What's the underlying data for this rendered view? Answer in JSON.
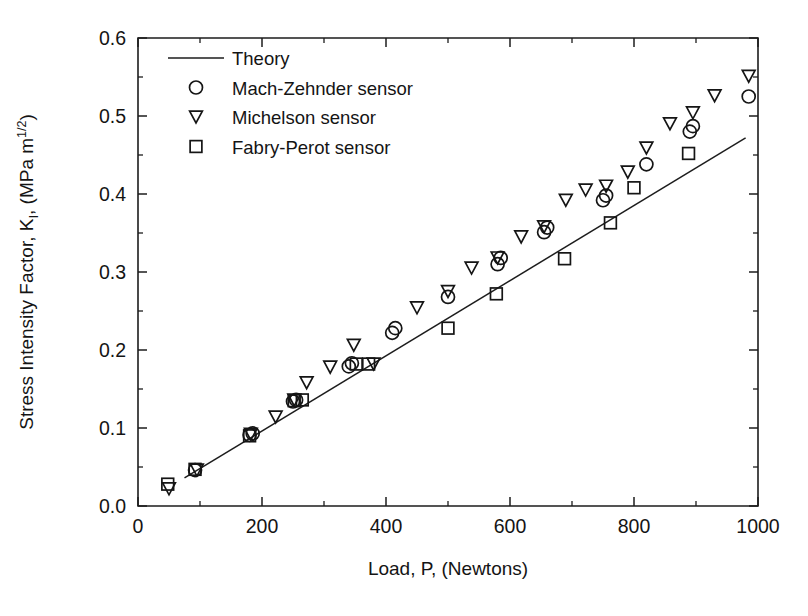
{
  "chart_data": {
    "type": "scatter",
    "title": "",
    "xlabel": "Load, P, (Newtons)",
    "ylabel": "Stress Intensity Factor, K",
    "ylabel_sub": "I",
    "ylabel_tail": ", (MPa m",
    "ylabel_sup": "1/2",
    "ylabel_end": ")",
    "xlim": [
      0,
      1000
    ],
    "ylim": [
      0.0,
      0.6
    ],
    "xticks": [
      0,
      200,
      400,
      600,
      800,
      1000
    ],
    "xticklabels": [
      "0",
      "200",
      "400",
      "600",
      "800",
      "1000"
    ],
    "xminorticks": [
      100,
      300,
      500,
      700,
      900
    ],
    "yticks": [
      0.0,
      0.1,
      0.2,
      0.3,
      0.4,
      0.5,
      0.6
    ],
    "yticklabels": [
      "0.0",
      "0.1",
      "0.2",
      "0.3",
      "0.4",
      "0.5",
      "0.6"
    ],
    "yminorticks": [
      0.05,
      0.15,
      0.25,
      0.35,
      0.45,
      0.55
    ],
    "grid": false,
    "legend_position": "upper-left",
    "legend": [
      {
        "label": "Theory",
        "marker": "line"
      },
      {
        "label": "Mach-Zehnder sensor",
        "marker": "circle"
      },
      {
        "label": "Michelson sensor",
        "marker": "triangle-down"
      },
      {
        "label": "Fabry-Perot sensor",
        "marker": "square"
      }
    ],
    "series": [
      {
        "name": "Theory",
        "marker": "line",
        "color": "#1d1d1d",
        "x": [
          75,
          980
        ],
        "y": [
          0.036,
          0.472
        ]
      },
      {
        "name": "Mach-Zehnder sensor",
        "marker": "circle",
        "color": "#151515",
        "points": [
          [
            92,
            0.046
          ],
          [
            180,
            0.091
          ],
          [
            185,
            0.093
          ],
          [
            250,
            0.134
          ],
          [
            255,
            0.136
          ],
          [
            340,
            0.179
          ],
          [
            345,
            0.183
          ],
          [
            410,
            0.222
          ],
          [
            415,
            0.228
          ],
          [
            500,
            0.268
          ],
          [
            580,
            0.31
          ],
          [
            585,
            0.318
          ],
          [
            655,
            0.351
          ],
          [
            660,
            0.357
          ],
          [
            750,
            0.392
          ],
          [
            755,
            0.398
          ],
          [
            820,
            0.438
          ],
          [
            890,
            0.48
          ],
          [
            895,
            0.487
          ],
          [
            985,
            0.525
          ]
        ]
      },
      {
        "name": "Michelson sensor",
        "marker": "triangle-down",
        "color": "#151515",
        "points": [
          [
            50,
            0.022
          ],
          [
            95,
            0.046
          ],
          [
            182,
            0.092
          ],
          [
            222,
            0.114
          ],
          [
            252,
            0.136
          ],
          [
            272,
            0.158
          ],
          [
            310,
            0.178
          ],
          [
            348,
            0.206
          ],
          [
            380,
            0.182
          ],
          [
            450,
            0.254
          ],
          [
            500,
            0.275
          ],
          [
            538,
            0.305
          ],
          [
            580,
            0.318
          ],
          [
            618,
            0.345
          ],
          [
            655,
            0.358
          ],
          [
            690,
            0.392
          ],
          [
            722,
            0.405
          ],
          [
            755,
            0.41
          ],
          [
            790,
            0.428
          ],
          [
            820,
            0.459
          ],
          [
            858,
            0.49
          ],
          [
            895,
            0.504
          ],
          [
            930,
            0.526
          ],
          [
            985,
            0.551
          ]
        ]
      },
      {
        "name": "Fabry-Perot sensor",
        "marker": "square",
        "color": "#151515",
        "points": [
          [
            48,
            0.028
          ],
          [
            92,
            0.047
          ],
          [
            180,
            0.09
          ],
          [
            252,
            0.135
          ],
          [
            265,
            0.136
          ],
          [
            352,
            0.182
          ],
          [
            372,
            0.182
          ],
          [
            500,
            0.228
          ],
          [
            578,
            0.272
          ],
          [
            688,
            0.317
          ],
          [
            762,
            0.363
          ],
          [
            800,
            0.408
          ],
          [
            888,
            0.452
          ]
        ]
      }
    ]
  },
  "geometry": {
    "plot_left": 138,
    "plot_right": 758,
    "plot_top": 38,
    "plot_bottom": 506
  }
}
